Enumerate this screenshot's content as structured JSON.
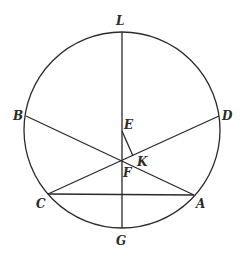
{
  "diagram": {
    "type": "geometry-circle",
    "stroke_color": "#2a2a2a",
    "circle": {
      "cx": 122,
      "cy": 130,
      "r": 98
    },
    "points": {
      "L": {
        "x": 122,
        "y": 32,
        "label": "L",
        "lx": 116,
        "ly": 25
      },
      "G": {
        "x": 122,
        "y": 228,
        "label": "G",
        "lx": 116,
        "ly": 245
      },
      "B": {
        "x": 26,
        "y": 116,
        "label": "B",
        "lx": 13,
        "ly": 120
      },
      "D": {
        "x": 219,
        "y": 116,
        "label": "D",
        "lx": 222,
        "ly": 120
      },
      "C": {
        "x": 48,
        "y": 194,
        "label": "C",
        "lx": 36,
        "ly": 208
      },
      "A": {
        "x": 194,
        "y": 195,
        "label": "A",
        "lx": 196,
        "ly": 208
      },
      "E": {
        "x": 122,
        "y": 131,
        "label": "E",
        "lx": 124,
        "ly": 129
      },
      "F": {
        "x": 122,
        "y": 161,
        "label": "F",
        "lx": 123,
        "ly": 177
      },
      "K": {
        "x": 133,
        "y": 156,
        "label": "K",
        "lx": 137,
        "ly": 166
      }
    },
    "segments": [
      {
        "name": "LG",
        "from": "L",
        "to": "G"
      },
      {
        "name": "BA",
        "from": "B",
        "to": "A"
      },
      {
        "name": "CD",
        "from": "C",
        "to": "D"
      },
      {
        "name": "CA",
        "from": "C",
        "to": "A"
      },
      {
        "name": "EK",
        "from": "E",
        "to": "K"
      }
    ]
  }
}
